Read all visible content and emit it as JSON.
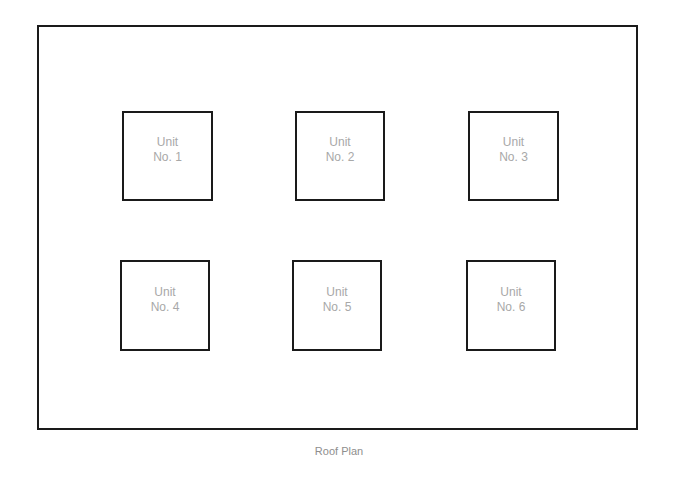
{
  "diagram": {
    "title": "Roof Plan",
    "colors": {
      "outline": "#1a1a1a",
      "unit_text": "#a8a8a8",
      "caption_text": "#8e8e8e",
      "background": "#ffffff"
    },
    "units": [
      {
        "line1": "Unit",
        "line2": "No. 1"
      },
      {
        "line1": "Unit",
        "line2": "No. 2"
      },
      {
        "line1": "Unit",
        "line2": "No. 3"
      },
      {
        "line1": "Unit",
        "line2": "No. 4"
      },
      {
        "line1": "Unit",
        "line2": "No. 5"
      },
      {
        "line1": "Unit",
        "line2": "No. 6"
      }
    ]
  }
}
